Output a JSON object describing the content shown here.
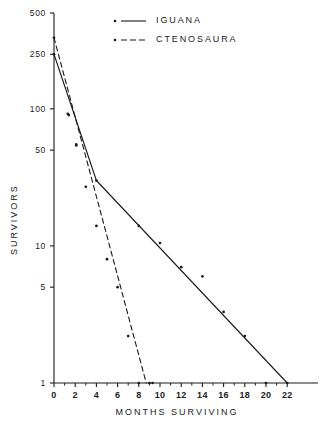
{
  "chart_data": {
    "type": "line",
    "title": "",
    "xlabel": "MONTHS SURVIVING",
    "ylabel": "SURVIVORS",
    "yscale": "log",
    "ylim": [
      1,
      500
    ],
    "xlim": [
      0,
      23
    ],
    "grid": false,
    "legend_position": "top-center",
    "y_ticks": [
      {
        "value": 500,
        "label": "500"
      },
      {
        "value": 250,
        "label": "250"
      },
      {
        "value": 100,
        "label": "100"
      },
      {
        "value": 50,
        "label": "50"
      },
      {
        "value": 10,
        "label": "10"
      },
      {
        "value": 5,
        "label": "5"
      },
      {
        "value": 1,
        "label": "1"
      }
    ],
    "x_ticks": [
      {
        "value": 0,
        "label": "0"
      },
      {
        "value": 2,
        "label": "2"
      },
      {
        "value": 4,
        "label": "4"
      },
      {
        "value": 6,
        "label": "6"
      },
      {
        "value": 8,
        "label": "8"
      },
      {
        "value": 10,
        "label": "10"
      },
      {
        "value": 12,
        "label": "12"
      },
      {
        "value": 14,
        "label": "14"
      },
      {
        "value": 16,
        "label": "16"
      },
      {
        "value": 18,
        "label": "18"
      },
      {
        "value": 20,
        "label": "20"
      },
      {
        "value": 22,
        "label": "22"
      }
    ],
    "x_minor_ticks": [
      1,
      3,
      5,
      7,
      9,
      11,
      13,
      15,
      17,
      19,
      21
    ],
    "series": [
      {
        "name": "IGUANA",
        "style": "solid",
        "marker": "dot",
        "fit_line": [
          {
            "x": 0,
            "y": 250
          },
          {
            "x": 4,
            "y": 30
          },
          {
            "x": 22,
            "y": 1
          }
        ],
        "points": [
          {
            "x": 0,
            "y": 250
          },
          {
            "x": 1.3,
            "y": 92
          },
          {
            "x": 2.1,
            "y": 54
          },
          {
            "x": 4,
            "y": 30
          },
          {
            "x": 8,
            "y": 14
          },
          {
            "x": 10,
            "y": 10.5
          },
          {
            "x": 12,
            "y": 7
          },
          {
            "x": 14,
            "y": 6
          },
          {
            "x": 16,
            "y": 3.3
          },
          {
            "x": 18,
            "y": 2.2
          },
          {
            "x": 20,
            "y": 1
          },
          {
            "x": 22,
            "y": 1
          }
        ]
      },
      {
        "name": "CTENOSAURA",
        "style": "dashed",
        "marker": "dot",
        "fit_line": [
          {
            "x": 0,
            "y": 330
          },
          {
            "x": 8.7,
            "y": 1
          }
        ],
        "points": [
          {
            "x": 0,
            "y": 330
          },
          {
            "x": 1.4,
            "y": 90
          },
          {
            "x": 2.1,
            "y": 55
          },
          {
            "x": 3,
            "y": 27
          },
          {
            "x": 4,
            "y": 14
          },
          {
            "x": 5,
            "y": 8
          },
          {
            "x": 6,
            "y": 5
          },
          {
            "x": 7,
            "y": 2.2
          },
          {
            "x": 8,
            "y": 1
          },
          {
            "x": 9,
            "y": 1
          },
          {
            "x": 9.3,
            "y": 1
          }
        ]
      }
    ]
  },
  "legend": {
    "items": [
      {
        "label": "IGUANA",
        "style": "solid"
      },
      {
        "label": "CTENOSAURA",
        "style": "dashed"
      }
    ]
  }
}
